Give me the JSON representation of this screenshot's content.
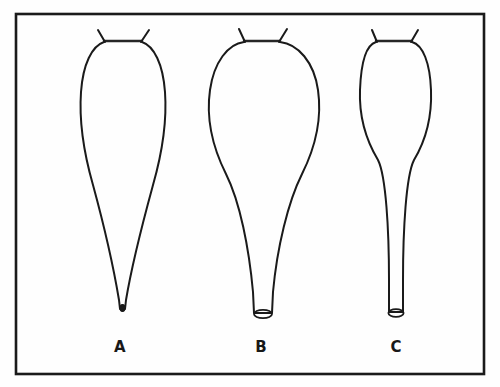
{
  "figure": {
    "background_color": "#fefefe",
    "stroke_color": "#1a1a1a",
    "frame": {
      "x": 16,
      "y": 14,
      "width": 468,
      "height": 360,
      "stroke_width": 2.6
    },
    "caption_font_size": 15
  },
  "panels": [
    {
      "id": "A",
      "label": "A",
      "label_x": 120,
      "label_y": 352,
      "center_x": 123,
      "description": "elongated pear-shaped body tapering to a closed narrow pointed tip",
      "body_top_y": 40,
      "body_widest_y": 108,
      "body_left_x": 80,
      "body_right_x": 166,
      "tip_y": 310,
      "tip_open": false,
      "tip_width": 4,
      "fundus_left_x": 104,
      "fundus_right_x": 142,
      "fundus_y": 41,
      "horns": [
        {
          "x1": 104,
          "y1": 41,
          "x2": 98,
          "y2": 30
        },
        {
          "x1": 142,
          "y1": 41,
          "x2": 149,
          "y2": 30
        }
      ]
    },
    {
      "id": "B",
      "label": "B",
      "label_x": 261,
      "label_y": 352,
      "center_x": 263,
      "description": "broad globular body with rounded shoulders narrowing to a short open cylindrical neck",
      "body_top_y": 40,
      "body_widest_y": 112,
      "body_left_x": 209,
      "body_right_x": 318,
      "tip_y": 318,
      "tip_open": true,
      "tip_width": 16,
      "fundus_left_x": 244,
      "fundus_right_x": 280,
      "fundus_y": 41,
      "horns": [
        {
          "x1": 244,
          "y1": 41,
          "x2": 239,
          "y2": 29
        },
        {
          "x1": 280,
          "y1": 41,
          "x2": 287,
          "y2": 29
        }
      ]
    },
    {
      "id": "C",
      "label": "C",
      "label_x": 396,
      "label_y": 352,
      "center_x": 396,
      "description": "narrow ovoid body continuing into a long parallel-sided open cylindrical neck",
      "body_top_y": 40,
      "body_widest_y": 108,
      "body_left_x": 360,
      "body_right_x": 431,
      "tip_y": 316,
      "tip_open": true,
      "tip_width": 14,
      "fundus_left_x": 376,
      "fundus_right_x": 412,
      "fundus_y": 41,
      "horns": [
        {
          "x1": 376,
          "y1": 41,
          "x2": 372,
          "y2": 30
        },
        {
          "x1": 412,
          "y1": 41,
          "x2": 418,
          "y2": 30
        }
      ]
    }
  ]
}
